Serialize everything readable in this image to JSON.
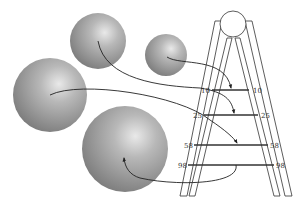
{
  "diagram": {
    "spheres": [
      {
        "name": "sphere-medium-top",
        "cx": 98,
        "cy": 41,
        "r": 28
      },
      {
        "name": "sphere-small",
        "cx": 166,
        "cy": 55,
        "r": 21
      },
      {
        "name": "sphere-large-left",
        "cx": 50,
        "cy": 95,
        "r": 37
      },
      {
        "name": "sphere-large-bottom",
        "cx": 125,
        "cy": 149,
        "r": 43
      }
    ],
    "rungs": [
      {
        "label_left": "10",
        "label_right": "10"
      },
      {
        "label_left": "25",
        "label_right": "25"
      },
      {
        "label_left": "58",
        "label_right": "58"
      },
      {
        "label_left": "98",
        "label_right": "98"
      }
    ],
    "colors": {
      "sphere_highlight": "#e8e8e8",
      "sphere_mid": "#a8a8a8",
      "sphere_edge": "#7a7a7a",
      "line": "#333333"
    }
  }
}
